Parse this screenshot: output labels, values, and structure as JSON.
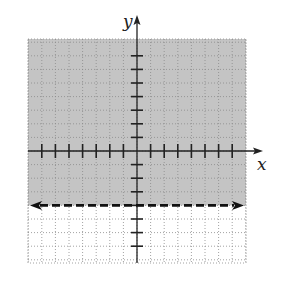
{
  "chart_data": {
    "type": "area",
    "title": "",
    "inequality": "y > -4",
    "boundary": {
      "equation": "y = -4",
      "style": "dashed",
      "arrows": "both"
    },
    "shaded_region": "above",
    "xlabel": "x",
    "ylabel": "y",
    "xlim": [
      -7.5,
      8.5
    ],
    "ylim": [
      -8.5,
      8
    ],
    "x_ticks": [
      -7,
      -6,
      -5,
      -4,
      -3,
      -2,
      -1,
      1,
      2,
      3,
      4,
      5,
      6,
      7
    ],
    "y_ticks": [
      -7,
      -6,
      -5,
      -4,
      -3,
      -2,
      -1,
      1,
      2,
      3,
      4,
      5,
      6,
      7
    ],
    "tick_labels_shown": false,
    "grid": true,
    "grid_style": "dotted",
    "colors": {
      "shade": "#c4c4c4",
      "axis": "#222222",
      "boundary": "#111111",
      "grid": "#8a8a8a"
    }
  },
  "labels": {
    "x_axis": "x",
    "y_axis": "y"
  }
}
